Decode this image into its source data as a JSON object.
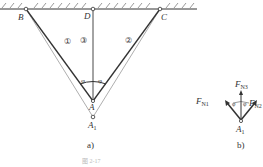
{
  "figure_a": {
    "points": {
      "B": "B",
      "D": "D",
      "C": "C",
      "A": "A",
      "A1_main": "A",
      "A1_sub": "1"
    },
    "members": {
      "bar1": "①",
      "bar2": "②",
      "bar3": "③"
    },
    "angles": {
      "left": "φ",
      "right": "φ"
    },
    "label": "a)"
  },
  "figure_b": {
    "forces": {
      "FN3_main": "F",
      "FN3_sub": "N3",
      "FN1_main": "F",
      "FN1_sub": "N1",
      "FN2_main": "F",
      "FN2_sub": "N2"
    },
    "angles": {
      "left": "φ",
      "right": "φ"
    },
    "node_main": "A",
    "node_sub": "1",
    "label": "b)"
  },
  "caption": "图 2-17",
  "colors": {
    "line": "#333333",
    "light_line": "#777777"
  }
}
